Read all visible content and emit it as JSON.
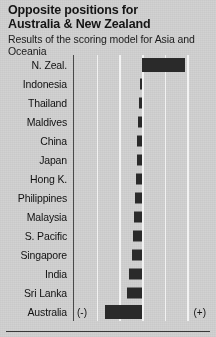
{
  "header": {
    "title": "Opposite positions for\nAustralia & New Zealand",
    "subtitle": "Results of the scoring model for Asia and Oceania"
  },
  "axis": {
    "negative_label": "(-)",
    "positive_label": "(+)"
  },
  "colors": {
    "background": "#d2d2d2",
    "bar": "#2a2a2a",
    "gridline": "#f2f2f2",
    "axis": "#4a4a4a",
    "text": "#111111"
  },
  "chart_data": {
    "type": "bar",
    "orientation": "horizontal",
    "title": "Opposite positions for Australia & New Zealand",
    "subtitle": "Results of the scoring model for Asia and Oceania",
    "xlabel": "",
    "ylabel": "",
    "grid": true,
    "legend": false,
    "xlim": [
      -3,
      3
    ],
    "xticks": [
      -3,
      -2,
      -1,
      0,
      1,
      2,
      3
    ],
    "xtick_labels": [
      "(-)",
      "",
      "",
      "",
      "",
      "",
      "(+)"
    ],
    "zero_baseline": 0,
    "categories": [
      "N. Zeal.",
      "Indonesia",
      "Thailand",
      "Maldives",
      "China",
      "Japan",
      "Hong K.",
      "Philippines",
      "Malaysia",
      "S. Pacific",
      "Singapore",
      "India",
      "Sri Lanka",
      "Australia"
    ],
    "values": [
      1.9,
      -0.08,
      -0.12,
      -0.16,
      -0.2,
      -0.22,
      -0.26,
      -0.3,
      -0.34,
      -0.38,
      -0.46,
      -0.58,
      -0.66,
      -1.65
    ]
  }
}
